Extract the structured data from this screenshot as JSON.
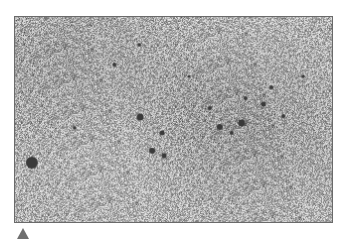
{
  "figure": {
    "frame": {
      "x": 14,
      "y": 16,
      "width": 319,
      "height": 207,
      "border_color": "#6a6a6a"
    },
    "texture": {
      "base_gray": 180,
      "noise_amplitude": 70,
      "density_regions": [
        {
          "cx": 0.15,
          "cy": 0.2,
          "r": 0.35,
          "darken": 18
        },
        {
          "cx": 0.75,
          "cy": 0.55,
          "r": 0.35,
          "darken": 22
        },
        {
          "cx": 0.55,
          "cy": 0.35,
          "r": 0.3,
          "darken": 10
        }
      ]
    },
    "spots": [
      {
        "x": 17,
        "y": 147,
        "r": 6
      },
      {
        "x": 126,
        "y": 101,
        "r": 3.5
      },
      {
        "x": 148,
        "y": 117,
        "r": 2.5
      },
      {
        "x": 138,
        "y": 135,
        "r": 3
      },
      {
        "x": 150,
        "y": 140,
        "r": 2.5
      },
      {
        "x": 206,
        "y": 111,
        "r": 3
      },
      {
        "x": 228,
        "y": 107,
        "r": 3.5
      },
      {
        "x": 250,
        "y": 88,
        "r": 2.5
      },
      {
        "x": 232,
        "y": 82,
        "r": 2
      },
      {
        "x": 258,
        "y": 71,
        "r": 2
      },
      {
        "x": 196,
        "y": 92,
        "r": 2
      },
      {
        "x": 218,
        "y": 117,
        "r": 2
      },
      {
        "x": 100,
        "y": 48,
        "r": 2
      },
      {
        "x": 125,
        "y": 28,
        "r": 1.8
      },
      {
        "x": 290,
        "y": 60,
        "r": 1.8
      },
      {
        "x": 60,
        "y": 112,
        "r": 1.8
      },
      {
        "x": 175,
        "y": 60,
        "r": 1.6
      },
      {
        "x": 270,
        "y": 100,
        "r": 2
      }
    ],
    "spot_color": "#3a3a3a"
  },
  "marker": {
    "shape": "triangle-up",
    "color": "#6f6f6f"
  }
}
